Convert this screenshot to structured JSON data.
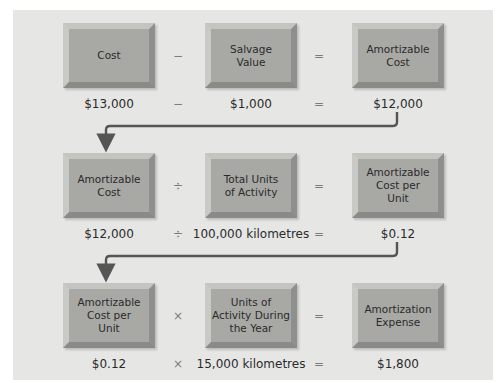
{
  "diagram": {
    "colors": {
      "panel": "#e6e6e5",
      "box_fill": "#a8a8a4",
      "connector": "#555555",
      "text": "#2b2b2b",
      "operator": "#7c7c7c"
    },
    "rows": [
      {
        "boxes": [
          "Cost",
          "Salvage\nValue",
          "Amortizable\nCost"
        ],
        "operators": [
          "−",
          "="
        ],
        "values": [
          "$13,000",
          "$1,000",
          "$12,000"
        ],
        "value_operators": [
          "−",
          "="
        ]
      },
      {
        "boxes": [
          "Amortizable\nCost",
          "Total Units\nof Activity",
          "Amortizable\nCost per\nUnit"
        ],
        "operators": [
          "÷",
          "="
        ],
        "values": [
          "$12,000",
          "100,000 kilometres",
          "$0.12"
        ],
        "value_operators": [
          "÷",
          "="
        ]
      },
      {
        "boxes": [
          "Amortizable\nCost per\nUnit",
          "Units of\nActivity During\nthe Year",
          "Amortization\nExpense"
        ],
        "operators": [
          "×",
          "="
        ],
        "values": [
          "$0.12",
          "15,000 kilometres",
          "$1,800"
        ],
        "value_operators": [
          "×",
          "="
        ]
      }
    ],
    "connectors": [
      {
        "from": "row1-result",
        "to": "row2-first-box"
      },
      {
        "from": "row2-result",
        "to": "row3-first-box"
      }
    ]
  }
}
